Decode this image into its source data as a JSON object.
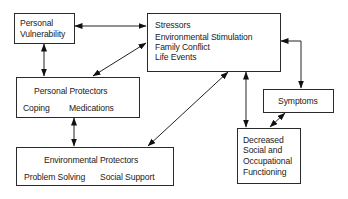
{
  "diagram": {
    "nodes": {
      "personal_vulnerability": {
        "lines": [
          "Personal",
          "Vulnerability"
        ]
      },
      "stressors": {
        "title": "Stressors",
        "items": [
          "Environmental Stimulation",
          "Family Conflict",
          "Life Events"
        ]
      },
      "personal_protectors": {
        "title": "Personal Protectors",
        "items": [
          "Coping",
          "Medications"
        ]
      },
      "environmental_protectors": {
        "title": "Environmental Protectors",
        "items": [
          "Problem Solving",
          "Social Support"
        ]
      },
      "symptoms": {
        "title": "Symptoms"
      },
      "decreased_functioning": {
        "lines": [
          "Decreased",
          "Social and",
          "Occupational",
          "Functioning"
        ]
      }
    },
    "edges": [
      {
        "from": "Personal Vulnerability",
        "to": "Stressors",
        "direction": "bidirectional"
      },
      {
        "from": "Personal Vulnerability",
        "to": "Personal Protectors",
        "direction": "bidirectional"
      },
      {
        "from": "Personal Protectors",
        "to": "Stressors",
        "direction": "bidirectional"
      },
      {
        "from": "Personal Protectors",
        "to": "Environmental Protectors",
        "direction": "bidirectional"
      },
      {
        "from": "Environmental Protectors",
        "to": "Stressors",
        "direction": "bidirectional"
      },
      {
        "from": "Stressors",
        "to": "Decreased Social and Occupational Functioning",
        "direction": "bidirectional"
      },
      {
        "from": "Stressors",
        "to": "Symptoms",
        "direction": "bidirectional"
      },
      {
        "from": "Symptoms",
        "to": "Decreased Social and Occupational Functioning",
        "direction": "bidirectional"
      }
    ]
  }
}
